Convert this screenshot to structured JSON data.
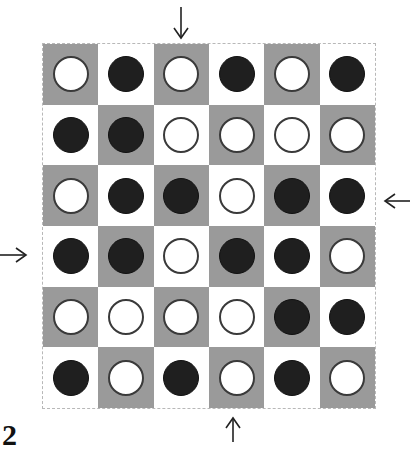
{
  "figure_label": "2",
  "colors": {
    "gray_cell": "#9a9a9a",
    "light_cell": "#ffffff",
    "black_piece": "#1f1f1f",
    "white_piece": "#ffffff"
  },
  "board": {
    "rows": 6,
    "cols": 6,
    "grid": [
      [
        "W",
        "B",
        "W",
        "B",
        "W",
        "B"
      ],
      [
        "B",
        "B",
        "W",
        "W",
        "W",
        "W"
      ],
      [
        "W",
        "B",
        "B",
        "W",
        "B",
        "B"
      ],
      [
        "B",
        "B",
        "W",
        "B",
        "B",
        "W"
      ],
      [
        "W",
        "W",
        "W",
        "W",
        "B",
        "B"
      ],
      [
        "B",
        "W",
        "B",
        "W",
        "B",
        "W"
      ]
    ]
  },
  "arrows": [
    {
      "name": "arrow-top",
      "direction": "down",
      "target": "column 3"
    },
    {
      "name": "arrow-right",
      "direction": "left",
      "target": "row 3"
    },
    {
      "name": "arrow-left",
      "direction": "right",
      "target": "row 4"
    },
    {
      "name": "arrow-bottom",
      "direction": "up",
      "target": "column 4"
    }
  ]
}
